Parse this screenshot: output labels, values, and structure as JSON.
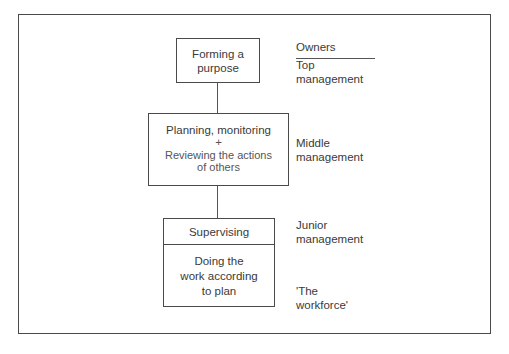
{
  "diagram": {
    "type": "hierarchy",
    "levels": [
      {
        "box_lines": [
          "Forming a",
          "purpose"
        ],
        "owner_lines": [
          "Top",
          "management"
        ]
      },
      {
        "box_lines": [
          "Planning, monitoring",
          "+",
          "Reviewing the actions",
          "of others"
        ],
        "owner_lines": [
          "Middle",
          "management"
        ]
      },
      {
        "box_top_lines": [
          "Supervising"
        ],
        "owner_top_lines": [
          "Junior",
          "management"
        ],
        "box_bottom_lines": [
          "Doing the",
          "work according",
          "to plan"
        ],
        "owner_bottom_lines": [
          "'The",
          "workforce'"
        ]
      }
    ],
    "owners_header": "Owners"
  }
}
